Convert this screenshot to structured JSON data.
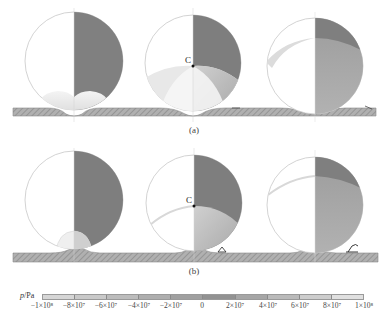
{
  "figure": {
    "rows": [
      {
        "label": "(a)",
        "panels": [
          {
            "id": "a1",
            "center_label": ""
          },
          {
            "id": "a2",
            "center_label": "C"
          },
          {
            "id": "a3",
            "center_label": ""
          }
        ]
      },
      {
        "label": "(b)",
        "panels": [
          {
            "id": "b1",
            "center_label": ""
          },
          {
            "id": "b2",
            "center_label": "C"
          },
          {
            "id": "b3",
            "center_label": ""
          }
        ]
      }
    ],
    "colorbar": {
      "title_var": "p",
      "title_unit": "/Pa",
      "ticks": [
        "−1×10⁸",
        "−8×10⁷",
        "−6×10⁷",
        "−4×10⁷",
        "−2×10⁷",
        "0",
        "2×10⁷",
        "4×10⁷",
        "6×10⁷",
        "8×10⁷",
        "1×10⁸"
      ],
      "segment_colors": [
        "#d6d6d6",
        "#c9c9c9",
        "#bcbcbc",
        "#aeaeae",
        "#a0a0a0",
        "#929292",
        "#a6a6a6",
        "#bababa",
        "#cdcdcd",
        "#e0e0e0"
      ]
    },
    "colors": {
      "bubble_dark": "#7f7f7f",
      "bubble_light": "#ffffff",
      "outline": "#bdbdbd",
      "wall": "#a8a8a8",
      "hatch": "#8c8c8c"
    }
  }
}
